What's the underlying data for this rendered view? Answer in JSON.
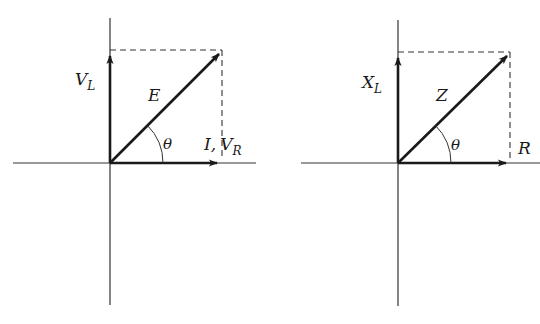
{
  "colors": {
    "ink": "#1a1a1a",
    "axis": "#333333",
    "background": "#ffffff"
  },
  "left_diagram": {
    "title": "Voltage phasor diagram",
    "vertical_vector": {
      "label": "V",
      "subscript": "L"
    },
    "horizontal_vector": {
      "label_prefix": "I,",
      "label": "V",
      "subscript": "R"
    },
    "resultant": {
      "label": "E"
    },
    "angle": {
      "label": "θ"
    }
  },
  "right_diagram": {
    "title": "Impedance diagram",
    "vertical_vector": {
      "label": "X",
      "subscript": "L"
    },
    "horizontal_vector": {
      "label": "R"
    },
    "resultant": {
      "label": "Z"
    },
    "angle": {
      "label": "θ"
    }
  }
}
